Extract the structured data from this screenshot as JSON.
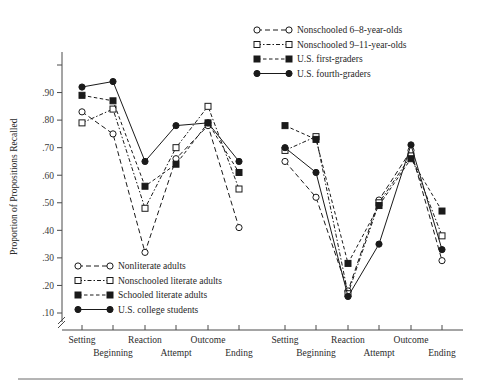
{
  "figure": {
    "y_axis_title": "Proportion of Propositions Recalled",
    "y_ticks": [
      ".90",
      ".80",
      ".70",
      ".60",
      ".50",
      ".40",
      ".30",
      ".20",
      ".10"
    ],
    "y_tick_values": [
      0.9,
      0.8,
      0.7,
      0.6,
      0.5,
      0.4,
      0.3,
      0.2,
      0.1
    ],
    "axis_break_symbol": "//",
    "categories_top": [
      "Setting",
      "Reaction",
      "Outcome"
    ],
    "categories_bottom": [
      "Beginning",
      "Attempt",
      "Ending"
    ],
    "categories_all": [
      "Setting",
      "Beginning",
      "Reaction",
      "Attempt",
      "Outcome",
      "Ending"
    ]
  },
  "legend_left": {
    "items": [
      {
        "label": "Nonliterate adults",
        "marker": "open-circle",
        "dash": "5,3"
      },
      {
        "label": "Nonschooled literate adults",
        "marker": "open-square",
        "dash": "4,2,1,2"
      },
      {
        "label": "Schooled literate adults",
        "marker": "filled-square",
        "dash": "3,2"
      },
      {
        "label": "U.S. college students",
        "marker": "filled-circle",
        "dash": "none"
      }
    ]
  },
  "legend_right": {
    "items": [
      {
        "label": "Nonschooled 6–8-year-olds",
        "marker": "open-circle",
        "dash": "5,3"
      },
      {
        "label": "Nonschooled 9–11-year-olds",
        "marker": "open-square",
        "dash": "4,2,1,2"
      },
      {
        "label": "U.S. first-graders",
        "marker": "filled-square",
        "dash": "3,2"
      },
      {
        "label": "U.S. fourth-graders",
        "marker": "filled-circle",
        "dash": "none"
      }
    ]
  },
  "chart_data": [
    {
      "type": "line",
      "panel": "left",
      "title": "",
      "xlabel": "",
      "ylabel": "Proportion of Propositions Recalled",
      "ylim": [
        0.1,
        1.0
      ],
      "grid": false,
      "legend_position": "inside-bottom-left",
      "categories": [
        "Setting",
        "Beginning",
        "Reaction",
        "Attempt",
        "Outcome",
        "Ending"
      ],
      "series": [
        {
          "name": "Nonliterate adults",
          "marker": "open-circle",
          "values": [
            0.83,
            0.75,
            0.32,
            0.66,
            0.78,
            0.41
          ]
        },
        {
          "name": "Nonschooled literate adults",
          "marker": "open-square",
          "values": [
            0.79,
            0.84,
            0.48,
            0.7,
            0.85,
            0.55
          ]
        },
        {
          "name": "Schooled literate adults",
          "marker": "filled-square",
          "values": [
            0.89,
            0.87,
            0.56,
            0.64,
            0.79,
            0.61
          ]
        },
        {
          "name": "U.S. college students",
          "marker": "filled-circle",
          "values": [
            0.92,
            0.94,
            0.65,
            0.78,
            0.79,
            0.65
          ]
        }
      ]
    },
    {
      "type": "line",
      "panel": "right",
      "title": "",
      "xlabel": "",
      "ylabel": "Proportion of Propositions Recalled",
      "ylim": [
        0.1,
        1.0
      ],
      "grid": false,
      "legend_position": "inside-top-right",
      "categories": [
        "Setting",
        "Beginning",
        "Reaction",
        "Attempt",
        "Outcome",
        "Ending"
      ],
      "series": [
        {
          "name": "Nonschooled 6–8-year-olds",
          "marker": "open-circle",
          "values": [
            0.65,
            0.52,
            0.18,
            0.51,
            0.69,
            0.29
          ]
        },
        {
          "name": "Nonschooled 9–11-year-olds",
          "marker": "open-square",
          "values": [
            0.69,
            0.74,
            0.17,
            0.5,
            0.67,
            0.38
          ]
        },
        {
          "name": "U.S. first-graders",
          "marker": "filled-square",
          "values": [
            0.78,
            0.73,
            0.28,
            0.49,
            0.66,
            0.47
          ]
        },
        {
          "name": "U.S. fourth-graders",
          "marker": "filled-circle",
          "values": [
            0.7,
            0.61,
            0.16,
            0.35,
            0.71,
            0.33
          ]
        }
      ]
    }
  ]
}
